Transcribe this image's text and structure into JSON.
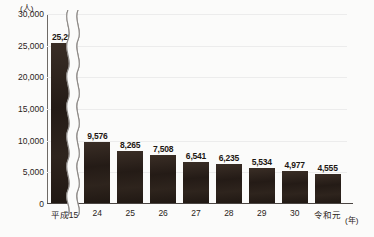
{
  "chart_data": {
    "type": "bar",
    "title": "",
    "xlabel": "(年)",
    "ylabel": "(人)",
    "categories": [
      "平成15",
      "24",
      "25",
      "26",
      "27",
      "28",
      "29",
      "30",
      "令和元"
    ],
    "values": [
      25296,
      9576,
      8265,
      7508,
      6541,
      6235,
      5534,
      4977,
      4555
    ],
    "value_labels": [
      "25,296",
      "9,576",
      "8,265",
      "7,508",
      "6,541",
      "6,235",
      "5,534",
      "4,977",
      "4,555"
    ],
    "ylim": [
      0,
      30000
    ],
    "y_ticks": [
      0,
      5000,
      10000,
      15000,
      20000,
      25000,
      30000
    ],
    "y_tick_labels": [
      "0",
      "5,000",
      "10,000",
      "15,000",
      "20,000",
      "25,000",
      "30,000"
    ],
    "grid": true,
    "legend": "none",
    "axis_break": {
      "present": true,
      "style": "wavy-vertical-double",
      "after_category": "平成15"
    },
    "bar_color": "#2b211b",
    "gridline_color": "#ececec",
    "axis_color": "#4a4542",
    "background_color": "#fbfbfa"
  }
}
